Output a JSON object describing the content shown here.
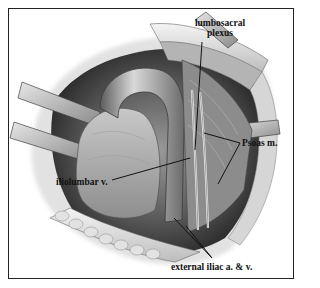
{
  "figure": {
    "type": "surgical anatomical illustration",
    "style": "grayscale pencil/airbrush drawing in a rectangular border",
    "border_color": "#222222",
    "background": "#ffffff"
  },
  "labels": {
    "lumbosacral_plexus_line1": "lumbosacral",
    "lumbosacral_plexus_line2": "plexus",
    "iliolumbar_vein": "iliolumbar v.",
    "psoas_muscle": "Psoas m.",
    "external_iliac": "external iliac a. & v."
  },
  "leader_lines": [
    {
      "label": "lumbosacral plexus",
      "from": [
        202,
        42
      ],
      "to": [
        195,
        150
      ]
    },
    {
      "label": "iliolumbar v.",
      "from": [
        112,
        180
      ],
      "to": [
        190,
        158
      ]
    },
    {
      "label": "Psoas m.",
      "from": [
        240,
        143
      ],
      "to": [
        204,
        133
      ]
    },
    {
      "label": "Psoas m.",
      "from": [
        240,
        143
      ],
      "to": [
        218,
        184
      ]
    },
    {
      "label": "external iliac a. & v.",
      "from": [
        212,
        258
      ],
      "to": [
        174,
        218
      ]
    },
    {
      "label": "external iliac a. & v.",
      "from": [
        212,
        258
      ],
      "to": [
        186,
        226
      ]
    }
  ]
}
